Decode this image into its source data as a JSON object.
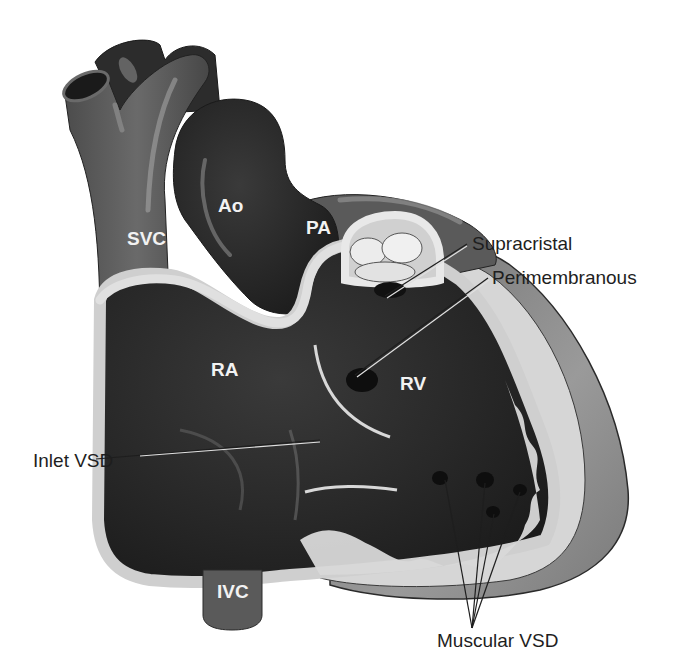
{
  "diagram": {
    "colors": {
      "background": "#ffffff",
      "vessel_gray": "#5e5e5e",
      "chamber_dark": "#262626",
      "wall_light": "#d8d8d8",
      "outer_wall": "#8a8a8a",
      "label_text": "#1e1e1e",
      "chamber_label": "#f2f2f2"
    },
    "chamber_labels": {
      "svc": "SVC",
      "ao": "Ao",
      "pa": "PA",
      "ra": "RA",
      "rv": "RV",
      "ivc": "IVC"
    },
    "callouts": {
      "supracristal": "Supracristal",
      "perimembranous": "Perimembranous",
      "inlet": "Inlet VSD",
      "muscular": "Muscular VSD"
    }
  }
}
